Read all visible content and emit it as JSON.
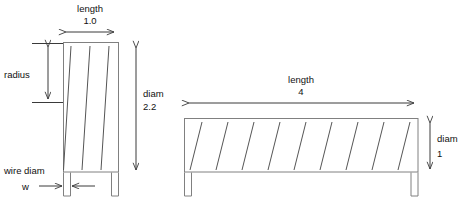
{
  "figure": {
    "type": "engineering-dimension-diagram",
    "colors": {
      "outline": "#808080",
      "wire": "#555555",
      "dimension": "#3a3a3a",
      "text": "#111111",
      "background": "#ffffff"
    }
  },
  "left_spring": {
    "name": "compressed-spring",
    "coil_count": 3,
    "labels": {
      "length_title": "length",
      "length_value": "1.0",
      "radius": "radius",
      "diam_title": "diam",
      "diam_value": "2.2",
      "wire_diam": "wire diam",
      "wire_symbol": "w"
    }
  },
  "right_spring": {
    "name": "extended-spring",
    "coil_count": 9,
    "labels": {
      "length_title": "length",
      "length_value": "4",
      "diam_title": "diam",
      "diam_value": "1"
    }
  },
  "geometry": {
    "left": {
      "body_x0": 63,
      "body_x1": 119,
      "body_y0": 42,
      "body_y1": 172,
      "leg_w": 7,
      "leg_bottom": 196,
      "wire_top_xs": [
        71,
        90,
        109
      ],
      "wire_bottom_xs": [
        63.5,
        82,
        101
      ],
      "len_arrow_y": 32,
      "len_arrow_x0": 63,
      "len_arrow_x1": 117,
      "radius_arrow_x": 48,
      "radius_arrow_y0": 44,
      "radius_arrow_y1": 102,
      "diam_arrow_x": 136,
      "diam_arrow_y0": 45,
      "diam_arrow_y1": 173,
      "w_arrow_y": 186
    },
    "right": {
      "body_x0": 184,
      "body_x1": 418,
      "body_y0": 118,
      "body_y1": 172,
      "leg_w": 7,
      "leg_bottom": 196,
      "wire_top_xs": [
        202,
        228,
        254,
        280,
        306,
        332,
        358,
        384,
        410
      ],
      "wire_bottom_xs": [
        190,
        216,
        242,
        268,
        294,
        320,
        346,
        372,
        398
      ],
      "len_arrow_y": 103,
      "len_arrow_x0": 186,
      "len_arrow_x1": 417,
      "diam_arrow_x": 430,
      "diam_arrow_y0": 120,
      "diam_arrow_y1": 172
    }
  }
}
